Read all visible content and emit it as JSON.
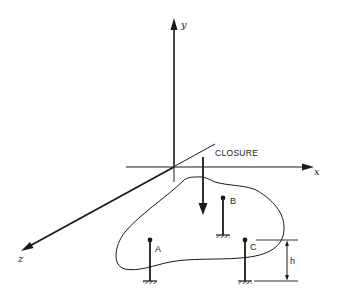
{
  "diagram": {
    "axes": {
      "y_label": "y",
      "x_label": "x",
      "z_label": "z"
    },
    "annotation": {
      "closure_label": "CLOSURE"
    },
    "columns": [
      {
        "label": "A"
      },
      {
        "label": "B"
      },
      {
        "label": "C"
      }
    ],
    "dimension": {
      "label": "h"
    },
    "colors": {
      "ink": "#1a1a1a",
      "background": "#ffffff"
    }
  }
}
